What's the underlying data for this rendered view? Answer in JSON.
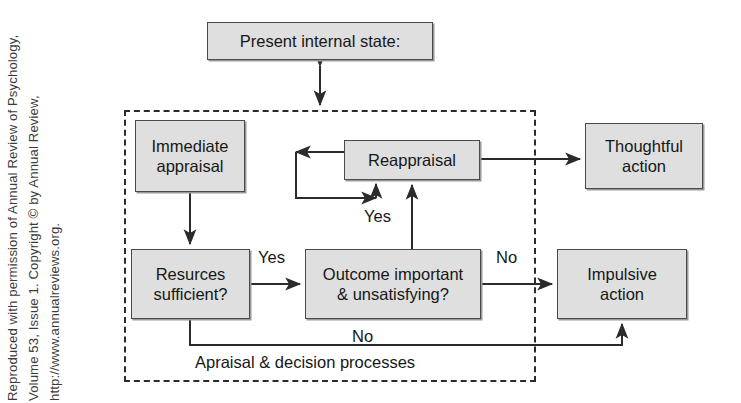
{
  "figure": {
    "kind": "flowchart-diagram",
    "credit_line": "Reproduced with permission of Annual Review of Psychology, Volume 53, Issue 1. Copyright © by Annual Review, http://www.annualreviews.org.",
    "background_color": "#ffffff",
    "node_fill_color": "#dfdfdf",
    "node_border_color": "#4a4a4a",
    "line_color": "#2b2b2b",
    "boundary_style": "dashed"
  },
  "nodes": {
    "present_internal_state": "Present internal state:",
    "immediate_appraisal": "Immediate\nappraisal",
    "immediate_appraisal_line1": "Immediate",
    "immediate_appraisal_line2": "appraisal",
    "reappraisal": "Reappraisal",
    "thoughtful_action_line1": "Thoughtful",
    "thoughtful_action_line2": "action",
    "resources_sufficient_line1": "Resurces",
    "resources_sufficient_line2": "sufficient?",
    "outcome_important_line1": "Outcome important",
    "outcome_important_line2": "& unsatisfying?",
    "impulsive_action_line1": "Impulsive",
    "impulsive_action_line2": "action"
  },
  "edge_labels": {
    "yes_resources_to_outcome": "Yes",
    "yes_outcome_to_reappraisal": "Yes",
    "no_outcome_to_impulsive": "No",
    "no_resources_to_impulsive": "No"
  },
  "boundary": {
    "label": "Apraisal & decision processes"
  },
  "edges": [
    {
      "from": "present_internal_state",
      "to": "appraisal_boundary",
      "arrow": "double"
    },
    {
      "from": "immediate_appraisal",
      "to": "resources_sufficient",
      "arrow": "single"
    },
    {
      "from": "resources_sufficient",
      "to": "outcome_important",
      "arrow": "single",
      "label": "Yes"
    },
    {
      "from": "outcome_important",
      "to": "reappraisal",
      "arrow": "single",
      "label": "Yes"
    },
    {
      "from": "outcome_important",
      "to": "impulsive_action",
      "arrow": "single",
      "label": "No"
    },
    {
      "from": "resources_sufficient",
      "to": "impulsive_action",
      "arrow": "single",
      "label": "No",
      "route": "bottom"
    },
    {
      "from": "reappraisal",
      "to": "thoughtful_action",
      "arrow": "single"
    },
    {
      "from": "reappraisal",
      "to": "reappraisal",
      "arrow": "single",
      "route": "self-loop-left"
    }
  ]
}
